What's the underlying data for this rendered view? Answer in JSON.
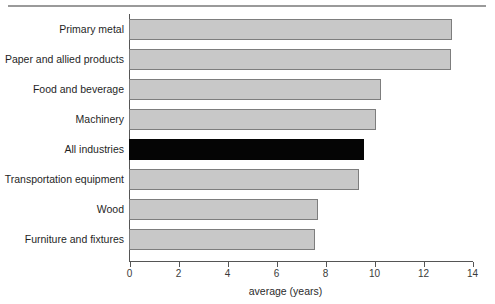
{
  "chart_data": {
    "type": "bar",
    "orientation": "horizontal",
    "title": "",
    "xlabel": "average (years)",
    "ylabel": "",
    "xlim": [
      0,
      14
    ],
    "xticks": [
      0,
      2,
      4,
      6,
      8,
      10,
      12,
      14
    ],
    "xtick_labels": [
      "0",
      "2",
      "4",
      "6",
      "8",
      "10",
      "12",
      "14"
    ],
    "grid": false,
    "legend": false,
    "categories": [
      "Primary metal",
      "Paper and allied products",
      "Food and beverage",
      "Machinery",
      "All industries",
      "Transportation equipment",
      "Wood",
      "Furniture and fixtures"
    ],
    "values": [
      13.2,
      13.15,
      10.3,
      10.1,
      9.6,
      9.4,
      7.7,
      7.6
    ],
    "highlight_category": "All industries",
    "colors": {
      "bar_fill": "#c8c8c8",
      "bar_border": "#7d7d7d",
      "highlight_fill": "#050505",
      "axis": "#555555",
      "background": "#ffffff",
      "top_rule": "#9a9a9a"
    }
  }
}
